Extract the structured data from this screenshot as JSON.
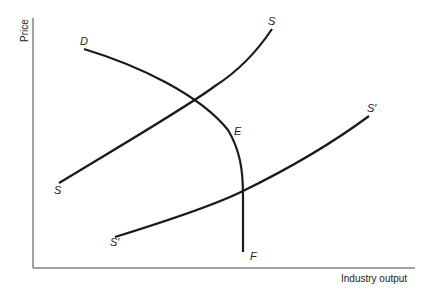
{
  "diagram": {
    "type": "supply-demand",
    "axes": {
      "y_label": "Price",
      "x_label": "Industry output"
    },
    "curves": [
      {
        "id": "D",
        "name": "Demand curve DEF",
        "labels": [
          "D",
          "E",
          "F"
        ]
      },
      {
        "id": "S",
        "name": "Supply curve SS",
        "labels": [
          "S",
          "S"
        ]
      },
      {
        "id": "S_prime",
        "name": "Supply curve S'S'",
        "labels": [
          "S′",
          "S′"
        ]
      }
    ],
    "labels": {
      "D": "D",
      "E": "E",
      "F": "F",
      "S_top": "S",
      "S_bottom": "S",
      "Sp_top": "S′",
      "Sp_bottom": "S′"
    },
    "colors": {
      "line": "#1a1a1a",
      "axis": "#444444",
      "background": "#ffffff"
    }
  }
}
